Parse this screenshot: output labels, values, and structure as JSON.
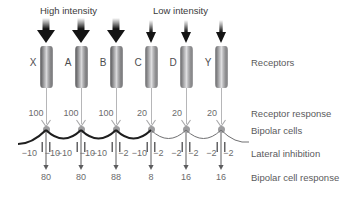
{
  "diagram": {
    "title_hint": "Lateral inhibition in receptor / bipolar cell network",
    "headers": [
      {
        "text": "High intensity",
        "x": 40,
        "y": 5
      },
      {
        "text": "Low intensity",
        "x": 153,
        "y": 5
      }
    ],
    "row_labels": [
      {
        "key": "receptors",
        "text": "Receptors",
        "y": 62
      },
      {
        "key": "receptor_response",
        "text": "Receptor response",
        "y": 114
      },
      {
        "key": "bipolar_cells",
        "text": "Bipolar cells",
        "y": 131
      },
      {
        "key": "lateral_inhibition",
        "text": "Lateral inhibition",
        "y": 153
      },
      {
        "key": "bipolar_cell_response",
        "text": "Bipolar cell response",
        "y": 176
      }
    ],
    "row_label_x": 251,
    "columns": [
      {
        "id": "X",
        "label": "X",
        "x": 46,
        "intensity": "high",
        "receptor_response": "100",
        "bipolar_response": "80"
      },
      {
        "id": "A",
        "label": "A",
        "x": 81,
        "intensity": "high",
        "receptor_response": "100",
        "bipolar_response": "80"
      },
      {
        "id": "B",
        "label": "B",
        "x": 116,
        "intensity": "high",
        "receptor_response": "100",
        "bipolar_response": "88"
      },
      {
        "id": "C",
        "label": "C",
        "x": 151,
        "intensity": "low",
        "receptor_response": "20",
        "bipolar_response": "8"
      },
      {
        "id": "D",
        "label": "D",
        "x": 186,
        "intensity": "low",
        "receptor_response": "20",
        "bipolar_response": "16"
      },
      {
        "id": "Y",
        "label": "Y",
        "x": 221,
        "intensity": "low",
        "receptor_response": "20",
        "bipolar_response": "16"
      }
    ],
    "inhibition_values": [
      {
        "text": "−10",
        "x": 29,
        "side": "left",
        "strong": true
      },
      {
        "text": "−10",
        "x": 52,
        "side": "right",
        "strong": true
      },
      {
        "text": "−10",
        "x": 64,
        "side": "left",
        "strong": true
      },
      {
        "text": "−10",
        "x": 87,
        "side": "right",
        "strong": true
      },
      {
        "text": "−10",
        "x": 99,
        "side": "left",
        "strong": true
      },
      {
        "text": "−2",
        "x": 123,
        "side": "right",
        "strong": true
      },
      {
        "text": "−10",
        "x": 139,
        "side": "left",
        "strong": true
      },
      {
        "text": "−2",
        "x": 158,
        "side": "right",
        "strong": false
      },
      {
        "text": "−2",
        "x": 176,
        "side": "left",
        "strong": false
      },
      {
        "text": "−2",
        "x": 193,
        "side": "right",
        "strong": false
      },
      {
        "text": "−2",
        "x": 211,
        "side": "left",
        "strong": false
      },
      {
        "text": "−2",
        "x": 228,
        "side": "right",
        "strong": false
      }
    ],
    "colors": {
      "text": "#58585a",
      "arrow_dark": "#1b1b1b",
      "cell_gray": "#9d9d9f",
      "line_gray": "#8d8d8f",
      "curve_strong": "#1f1f1f",
      "curve_weak": "#6e6e70",
      "background": "#ffffff"
    },
    "geometry": {
      "arrow_top_y": 18,
      "arrow_bottom_y": 43,
      "cylinder_top_y": 46,
      "cylinder_height": 42,
      "receptor_letter_y": 62,
      "response_number_y": 113,
      "dot_y": 129,
      "curve_baseline_y": 143,
      "inhibition_number_y": 152,
      "bipolar_number_y": 175
    }
  }
}
